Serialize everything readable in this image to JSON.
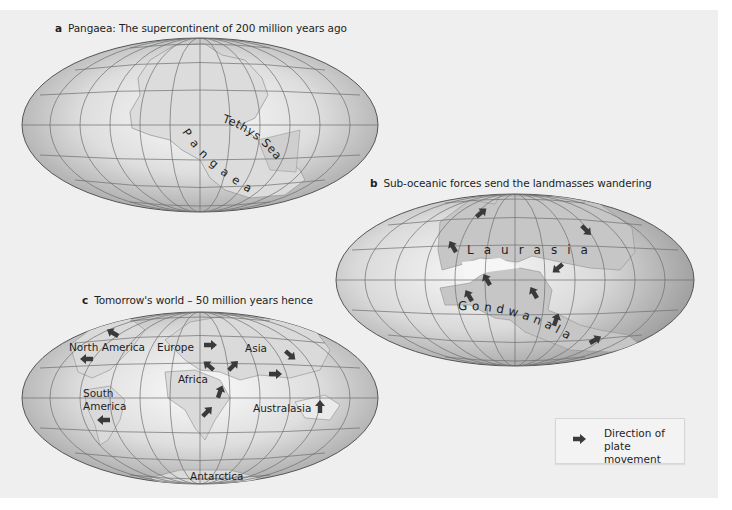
{
  "colors": {
    "panel_bg": "#efefef",
    "ocean_center": "#f7f7f7",
    "ocean_edge": "#a9a9a9",
    "land": "#c9c9c9",
    "land_stroke": "#9a9a9a",
    "graticule": "#6e6e6e",
    "arrow": "#3a3a3a",
    "text": "#1e1e1e"
  },
  "maps": [
    {
      "id": "a",
      "letter": "a",
      "caption": "Pangaea: The supercontinent of 200 million years ago",
      "labels": [
        "Pangaea",
        "Tethys Sea"
      ]
    },
    {
      "id": "b",
      "letter": "b",
      "caption": "Sub-oceanic forces send the landmasses wandering",
      "labels": [
        "Laurasia",
        "Gondwanaland"
      ],
      "arrow_count": 10
    },
    {
      "id": "c",
      "letter": "c",
      "caption": "Tomorrow's world – 50 million years hence",
      "labels": [
        "North America",
        "South America",
        "Europe",
        "Africa",
        "Asia",
        "Australasia",
        "Antarctica"
      ],
      "arrow_count": 12
    }
  ],
  "map_a": {
    "caption_letter": "a",
    "caption_text": "Pangaea: The supercontinent of 200 million years ago",
    "tethys_label": "Tethys Sea",
    "pangaea_label": "Pangaea"
  },
  "map_b": {
    "caption_letter": "b",
    "caption_text": "Sub-oceanic forces send the landmasses wandering",
    "laurasia_label": "Laurasia",
    "gondwanaland_label": "Gondwanaland"
  },
  "map_c": {
    "caption_letter": "c",
    "caption_text": "Tomorrow's world – 50 million years hence",
    "north_america": "North America",
    "south_america_1": "South",
    "south_america_2": "America",
    "europe": "Europe",
    "africa": "Africa",
    "asia": "Asia",
    "australasia": "Australasia",
    "antarctica": "Antarctica"
  },
  "legend": {
    "icon": "arrow-right-icon",
    "text": "Direction of plate movement"
  }
}
